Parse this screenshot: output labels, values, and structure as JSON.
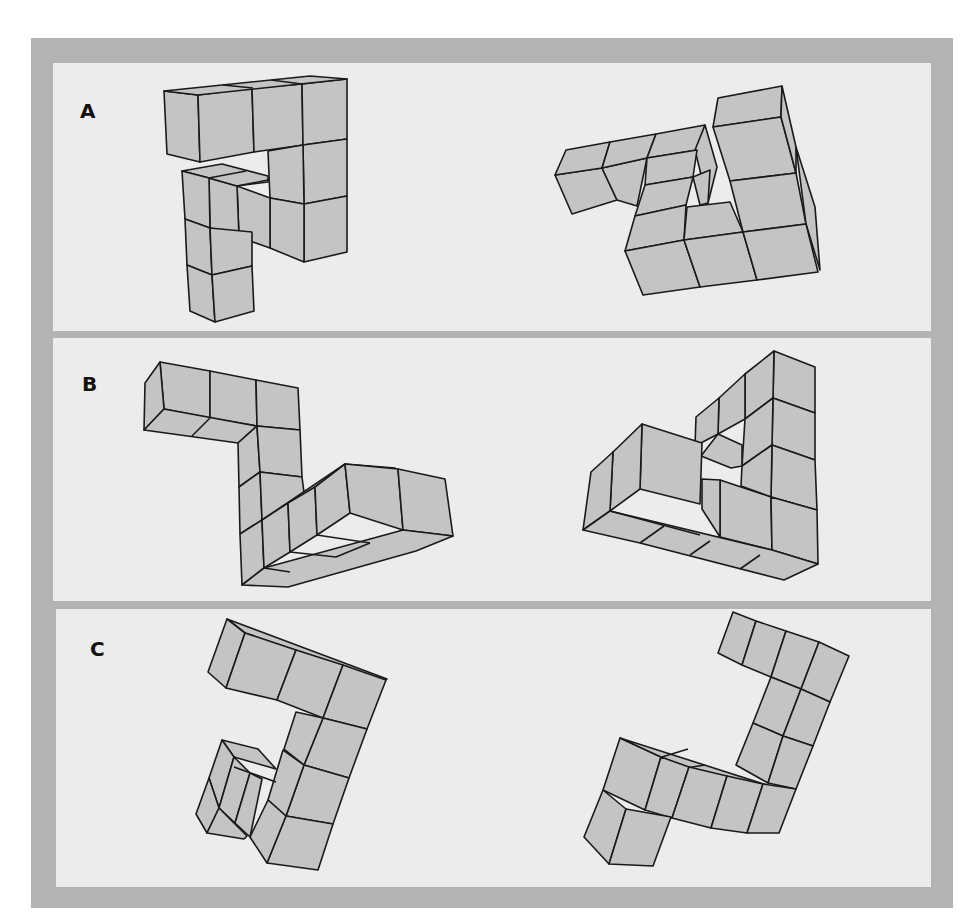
{
  "figure": {
    "colors": {
      "frame": "#b3b3b3",
      "panel_background": "#ececec",
      "cube_face": "#c4c4c4",
      "edge": "#1a1a1a"
    },
    "panels": [
      {
        "label": "A",
        "objects": [
          "left-cube-assembly",
          "right-cube-assembly"
        ]
      },
      {
        "label": "B",
        "objects": [
          "left-cube-assembly",
          "right-cube-assembly"
        ]
      },
      {
        "label": "C",
        "objects": [
          "left-cube-assembly",
          "right-cube-assembly"
        ]
      }
    ]
  }
}
